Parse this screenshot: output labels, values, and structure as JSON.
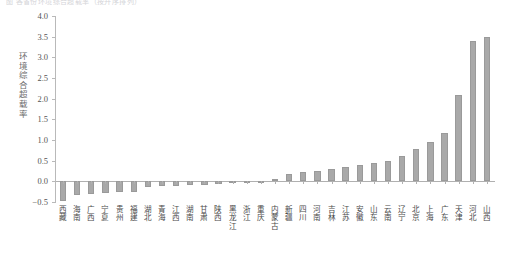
{
  "caption": "图 各省份环境综合超载率（按升序排列）",
  "chart_data": {
    "type": "bar",
    "title": "",
    "subtitle": "",
    "xlabel": "",
    "ylabel": "环境综合超载率",
    "ylim": [
      -0.5,
      4.0
    ],
    "ytick_step": 0.5,
    "yticks": [
      "4.0",
      "3.5",
      "3.0",
      "2.5",
      "2.0",
      "1.5",
      "1.0",
      "0.5",
      "0.0",
      "-0.5"
    ],
    "grid": false,
    "legend": null,
    "bar_color": "#a9a9a9",
    "axis_color": "#b0b0b0",
    "categories": [
      "西藏",
      "海南",
      "广西",
      "宁夏",
      "贵州",
      "福建",
      "湖北",
      "青海",
      "江西",
      "湖南",
      "甘肃",
      "陕西",
      "黑龙江",
      "浙江",
      "重庆",
      "内蒙古",
      "新疆",
      "四川",
      "河南",
      "吉林",
      "江苏",
      "安徽",
      "山东",
      "云南",
      "辽宁",
      "北京",
      "上海",
      "广东",
      "天津",
      "河北",
      "山西"
    ],
    "values": [
      -0.48,
      -0.34,
      -0.3,
      -0.28,
      -0.27,
      -0.26,
      -0.14,
      -0.12,
      -0.11,
      -0.1,
      -0.08,
      -0.06,
      -0.04,
      -0.02,
      0.02,
      0.05,
      0.18,
      0.22,
      0.26,
      0.3,
      0.35,
      0.4,
      0.44,
      0.5,
      0.62,
      0.78,
      0.95,
      1.18,
      2.1,
      3.4,
      3.5
    ]
  }
}
